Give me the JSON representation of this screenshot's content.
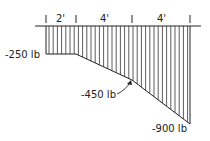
{
  "diagram": {
    "type": "shear-diagram",
    "spans": [
      {
        "label": "2'",
        "length_ft": 2
      },
      {
        "label": "4'",
        "length_ft": 4
      },
      {
        "label": "4'",
        "length_ft": 4
      }
    ],
    "values": [
      {
        "label": "-250 lb",
        "value": -250
      },
      {
        "label": "-450 lb",
        "value": -450
      },
      {
        "label": "-900 lb",
        "value": -900
      }
    ],
    "colors": {
      "ink": "#222222",
      "background": "#ffffff"
    }
  }
}
